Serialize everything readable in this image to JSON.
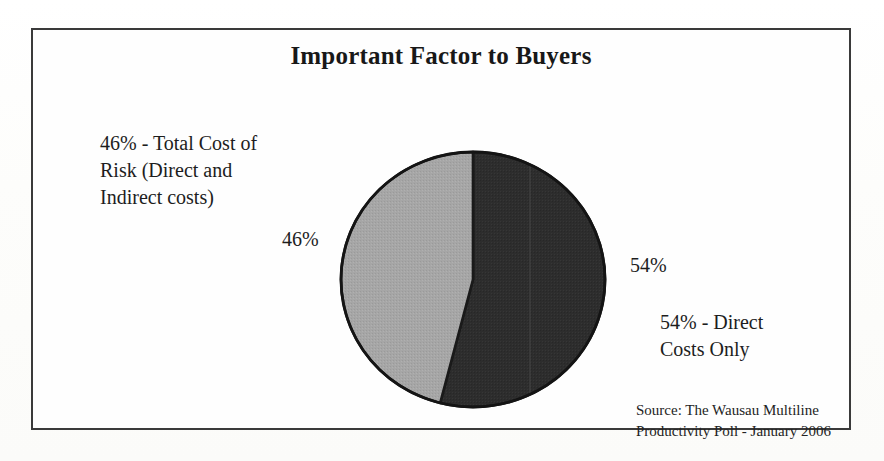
{
  "chart_data": {
    "type": "pie",
    "title": "Important Factor to Buyers",
    "categories": [
      "Direct Costs Only",
      "Total Cost of Risk (Direct and Indirect costs)"
    ],
    "values": [
      54,
      46
    ],
    "value_labels": [
      "54%",
      "46%"
    ],
    "unit": "percent",
    "start_angle_deg": 0,
    "direction": "clockwise",
    "legend": "none",
    "grid": false,
    "colors": {
      "slice_direct_costs": "#2d2d2d",
      "slice_total_cost_of_risk": "#a3a3a3",
      "outline": "#1a1a1a",
      "frame": "#3a3a3a",
      "background": "#fefefe",
      "text": "#1a1a1a"
    },
    "annotations": [
      "46% - Total Cost of Risk (Direct and Indirect costs)",
      "54% - Direct Costs Only"
    ],
    "source": "Source: The Wausau Multiline Productivity Poll - January 2006"
  },
  "chart": {
    "title": "Important Factor to Buyers",
    "left_label_description": "46% - Total Cost of\nRisk (Direct and\nIndirect costs)",
    "left_label_value": "46%",
    "right_label_value": "54%",
    "right_label_description": "54% - Direct\nCosts Only",
    "source_note": "Source: The Wausau Multiline\nProductivity Poll - January 2006"
  }
}
